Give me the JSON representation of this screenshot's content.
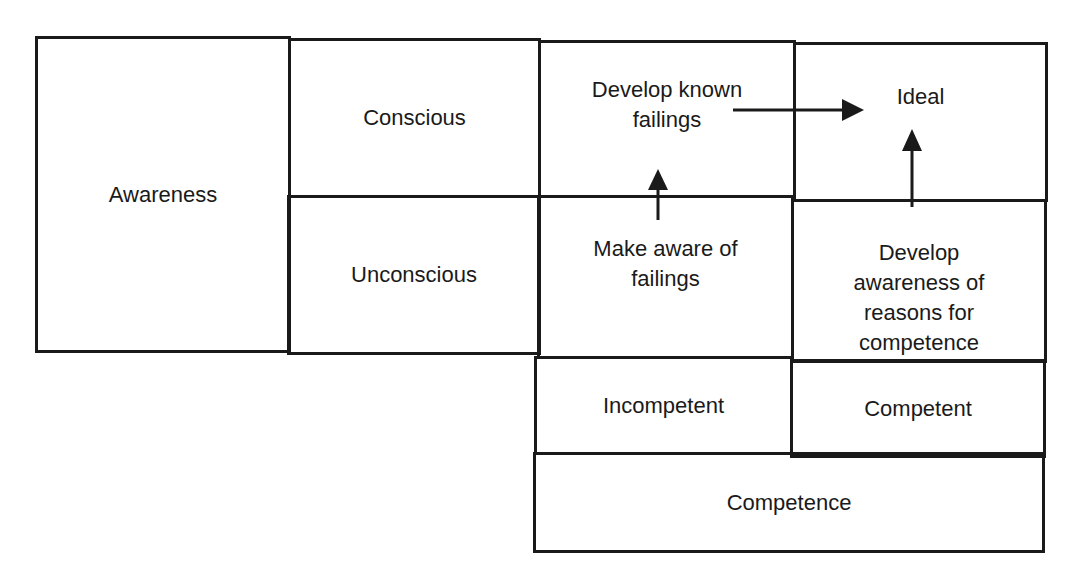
{
  "diagram": {
    "type": "matrix",
    "axes": {
      "vertical_label": "Awareness",
      "horizontal_label": "Competence"
    },
    "row_labels": [
      "Conscious",
      "Unconscious"
    ],
    "column_labels": [
      "Incompetent",
      "Competent"
    ],
    "cells": {
      "conscious_incompetent": "Develop known failings",
      "conscious_competent": "Ideal",
      "unconscious_incompetent": "Make aware of failings",
      "unconscious_competent": "Develop awareness of reasons for competence"
    },
    "arrows": [
      {
        "from": "Make aware of failings",
        "to": "Develop known failings",
        "direction": "up"
      },
      {
        "from": "Develop known failings",
        "to": "Ideal",
        "direction": "right"
      },
      {
        "from": "Develop awareness of reasons for competence",
        "to": "Ideal",
        "direction": "up"
      }
    ],
    "line_color": "#1a1a1a",
    "background": "#ffffff"
  }
}
